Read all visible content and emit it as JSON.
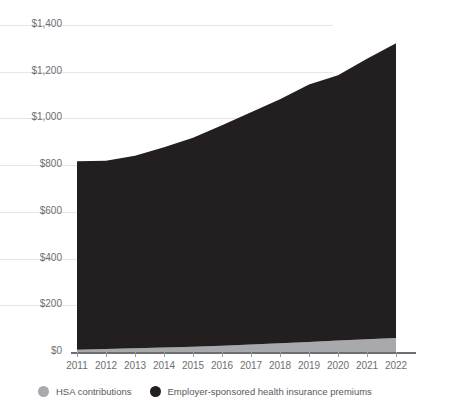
{
  "chart_data": {
    "type": "area",
    "stacked": true,
    "title": "",
    "xlabel": "",
    "ylabel": "U.S. dollars (billions)",
    "x": [
      2011,
      2012,
      2013,
      2014,
      2015,
      2016,
      2017,
      2018,
      2019,
      2020,
      2021,
      2022
    ],
    "categories": [
      "2011",
      "2012",
      "2013",
      "2014",
      "2015",
      "2016",
      "2017",
      "2018",
      "2019",
      "2020",
      "2021",
      "2022"
    ],
    "series": [
      {
        "name": "HSA contributions",
        "color": "#a7a9ac",
        "values": [
          10,
          13,
          16,
          19,
          23,
          27,
          32,
          37,
          43,
          49,
          55,
          60
        ]
      },
      {
        "name": "Employer-sponsored health insurance premiums",
        "color": "#231f20",
        "values": [
          807,
          806,
          824,
          858,
          894,
          944,
          994,
          1045,
          1102,
          1136,
          1200,
          1262
        ]
      }
    ],
    "totals": [
      817,
      819,
      840,
      877,
      917,
      971,
      1026,
      1082,
      1145,
      1185,
      1255,
      1322
    ],
    "ylim": [
      0,
      1400
    ],
    "yticks": [
      0,
      200,
      400,
      600,
      800,
      1000,
      1200,
      1400
    ],
    "ytick_labels": [
      "$0",
      "$200",
      "$400",
      "$600",
      "$800",
      "$1,000",
      "$1,200",
      "$1,400"
    ],
    "grid": true,
    "legend_position": "bottom"
  },
  "legend": {
    "items": [
      {
        "label": "HSA contributions",
        "color": "#a7a9ac",
        "marker": "circle-dot"
      },
      {
        "label": "Employer-sponsored health insurance premiums",
        "color": "#231f20",
        "marker": "circle-dot"
      }
    ]
  },
  "axes": {
    "y_title": "U.S. dollars (billions)"
  },
  "colors": {
    "grid": "#e6e6e8",
    "axis": "#6d6e71",
    "hsa": "#a7a9ac",
    "premiums": "#231f20",
    "background": "#ffffff"
  }
}
